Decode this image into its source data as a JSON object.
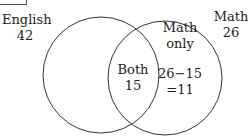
{
  "diagram": {
    "type": "venn",
    "sets": [
      {
        "name": "English",
        "label": "English",
        "value": "42"
      },
      {
        "name": "Math",
        "label": "Math",
        "value": "26"
      }
    ],
    "regions": {
      "both": {
        "label": "Both",
        "value": "15"
      },
      "math_only": {
        "label_line1": "Math",
        "label_line2": "only",
        "calc_line1": "26−15",
        "calc_line2": "=11"
      }
    },
    "colors": {
      "stroke": "#333333",
      "text": "#222222",
      "background": "#ffffff"
    }
  }
}
